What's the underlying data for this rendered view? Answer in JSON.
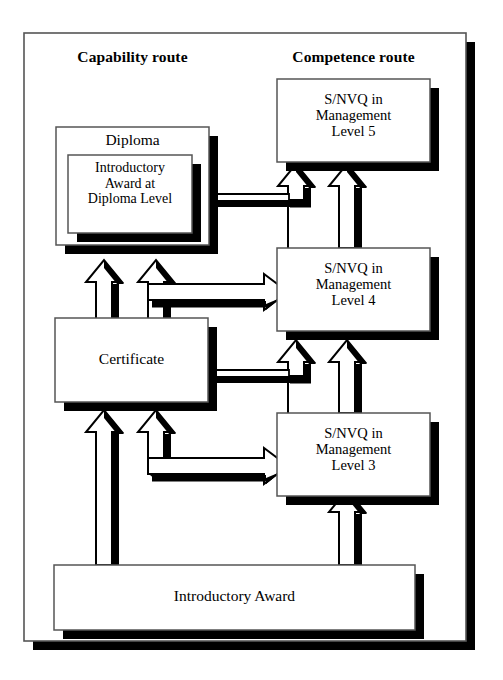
{
  "diagram": {
    "type": "flow-diagram",
    "columns": [
      {
        "id": "capability",
        "label": "Capability route"
      },
      {
        "id": "competence",
        "label": "Competence route"
      }
    ],
    "nodes": {
      "diploma": {
        "label": "Diploma"
      },
      "intro_award_diploma": {
        "label": "Introductory\nAward at\nDiploma Level"
      },
      "certificate": {
        "label": "Certificate"
      },
      "introductory_award": {
        "label": "Introductory Award"
      },
      "snvq5": {
        "label": "S/NVQ in\nManagement\nLevel 5"
      },
      "snvq4": {
        "label": "S/NVQ in\nManagement\nLevel 4"
      },
      "snvq3": {
        "label": "S/NVQ in\nManagement\nLevel 3"
      }
    },
    "edges": [
      {
        "from": "certificate",
        "to": "diploma",
        "style": "block-arrow-up"
      },
      {
        "from": "certificate",
        "to": "diploma",
        "style": "block-arrow-up"
      },
      {
        "from": "certificate",
        "to": "snvq4",
        "style": "block-arrow-right"
      },
      {
        "from": "introductory_award",
        "to": "certificate",
        "style": "block-arrow-up"
      },
      {
        "from": "introductory_award",
        "to": "certificate",
        "style": "block-arrow-up"
      },
      {
        "from": "certificate",
        "to": "snvq3",
        "style": "block-arrow-right"
      },
      {
        "from": "snvq4",
        "to": "snvq5",
        "style": "block-arrow-up"
      },
      {
        "from": "snvq4",
        "to": "snvq5",
        "style": "block-arrow-up"
      },
      {
        "from": "snvq3",
        "to": "snvq4",
        "style": "block-arrow-up"
      },
      {
        "from": "introductory_award",
        "to": "snvq3",
        "style": "block-arrow-up"
      }
    ],
    "colors": {
      "ink": "#000000",
      "paper": "#ffffff",
      "shadow": "#000000",
      "outline": "#4a4a4a"
    }
  }
}
